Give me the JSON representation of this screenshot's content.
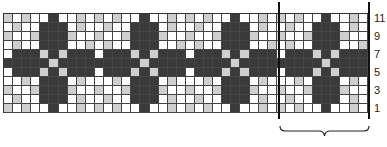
{
  "chart_data": {
    "type": "heatmap",
    "title": "",
    "columns": 40,
    "rows": 11,
    "repeat_width": 10,
    "repeats": 4,
    "legend": {
      "0": "white",
      "1": "light grey",
      "2": "dark grey"
    },
    "colors": {
      "0": "#ffffff",
      "1": "#cfcfcf",
      "2": "#3a3a3a"
    },
    "repeat_pattern_top_to_bottom": [
      [
        1,
        0,
        1,
        0,
        0,
        2,
        0,
        0,
        1,
        0
      ],
      [
        0,
        1,
        0,
        0,
        2,
        2,
        2,
        0,
        1,
        0
      ],
      [
        1,
        0,
        0,
        1,
        2,
        2,
        2,
        1,
        0,
        0
      ],
      [
        0,
        1,
        0,
        0,
        2,
        2,
        2,
        0,
        0,
        1
      ],
      [
        0,
        2,
        2,
        2,
        1,
        2,
        1,
        2,
        2,
        2
      ],
      [
        2,
        2,
        2,
        2,
        2,
        1,
        2,
        2,
        2,
        2
      ],
      [
        0,
        2,
        2,
        2,
        1,
        2,
        1,
        2,
        2,
        2
      ],
      [
        0,
        0,
        1,
        0,
        2,
        2,
        2,
        0,
        1,
        0
      ],
      [
        1,
        0,
        0,
        1,
        2,
        2,
        2,
        1,
        0,
        0
      ],
      [
        0,
        1,
        0,
        0,
        2,
        2,
        2,
        0,
        1,
        0
      ],
      [
        1,
        0,
        1,
        0,
        0,
        2,
        0,
        0,
        1,
        0
      ]
    ],
    "row_labels": [
      {
        "label": "11",
        "row": 11
      },
      {
        "label": "9",
        "row": 9
      },
      {
        "label": "7",
        "row": 7
      },
      {
        "label": "5",
        "row": 5
      },
      {
        "label": "3",
        "row": 3
      },
      {
        "label": "1",
        "row": 1
      }
    ],
    "repeat_marker": {
      "start_col": 30,
      "end_col": 40,
      "bracket": true
    }
  }
}
